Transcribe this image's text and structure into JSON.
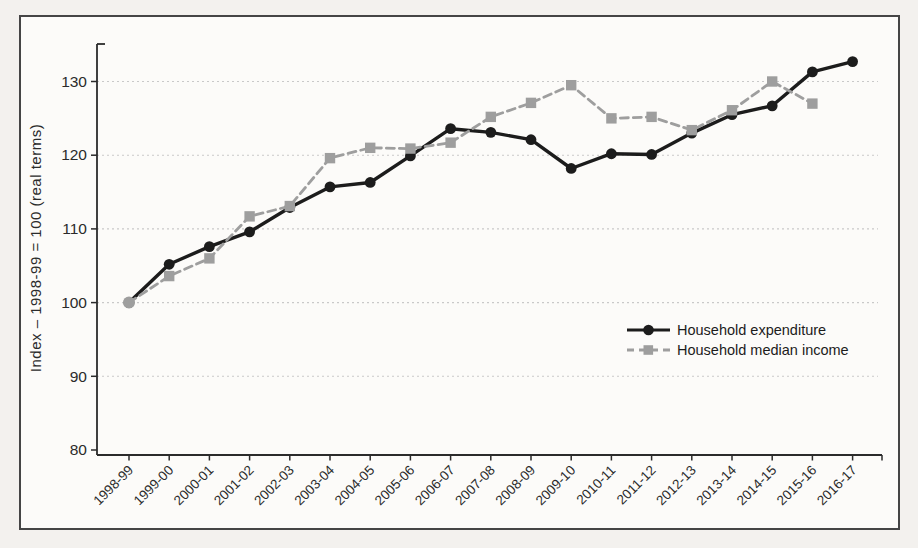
{
  "chart_data": {
    "type": "line",
    "title": "",
    "ylabel": "Index – 1998-99 = 100 (real terms)",
    "xlabel": "",
    "categories": [
      "1998-99",
      "1999-00",
      "2000-01",
      "2001-02",
      "2002-03",
      "2003-04",
      "2004-05",
      "2005-06",
      "2006-07",
      "2007-08",
      "2008-09",
      "2009-10",
      "2010-11",
      "2011-12",
      "2012-13",
      "2013-14",
      "2014-15",
      "2015-16",
      "2016-17"
    ],
    "series": [
      {
        "name": "Household expenditure",
        "marker": "circle",
        "line_style": "solid",
        "color": "#1c1c1c",
        "values": [
          100,
          105.2,
          107.6,
          109.6,
          112.9,
          115.7,
          116.3,
          119.9,
          123.6,
          123.1,
          122.1,
          118.2,
          120.2,
          120.1,
          123.0,
          125.5,
          126.7,
          131.3,
          132.7
        ]
      },
      {
        "name": "Household median income",
        "marker": "square",
        "line_style": "dashed",
        "color": "#9e9e9e",
        "values": [
          100,
          103.6,
          106.0,
          111.7,
          113.1,
          119.6,
          121.0,
          120.9,
          121.7,
          125.2,
          127.1,
          129.5,
          125.0,
          125.2,
          123.4,
          126.1,
          130.0,
          127.0,
          null
        ]
      }
    ],
    "ylim": [
      80,
      135
    ],
    "yticks": [
      80,
      90,
      100,
      110,
      120,
      130
    ],
    "grid": "horizontal dotted",
    "legend_position": "inside right-middle"
  },
  "colors": {
    "axis": "#2b2b2b",
    "grid": "#c9c9c9",
    "panel_bg": "#fcfbf9",
    "page_bg": "#f3f1ee",
    "border": "#454545"
  }
}
